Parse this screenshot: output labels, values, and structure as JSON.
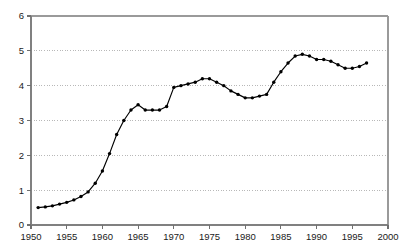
{
  "chart_data": {
    "type": "line",
    "title": "",
    "subtitle": "",
    "xlabel": "",
    "ylabel": "",
    "xlim": [
      1950,
      2000
    ],
    "ylim": [
      0,
      6
    ],
    "xticks": [
      1950,
      1955,
      1960,
      1965,
      1970,
      1975,
      1980,
      1985,
      1990,
      1995,
      2000
    ],
    "xtick_labels": [
      "1950",
      "1955",
      "1960",
      "1965",
      "1970",
      "1975",
      "1980",
      "1985",
      "1990",
      "1995",
      "2000"
    ],
    "yticks": [
      0,
      1,
      2,
      3,
      4,
      5,
      6
    ],
    "ytick_labels": [
      "0",
      "1",
      "2",
      "3",
      "4",
      "5",
      "6"
    ],
    "grid": {
      "horizontal": true,
      "vertical": false,
      "style": "dotted",
      "values": [
        1,
        2,
        3,
        4,
        5
      ]
    },
    "legend": null,
    "legend_position": "none",
    "annotations": [],
    "marker": "filled-circle",
    "line_color": "#000000",
    "marker_color": "#000000",
    "series": [
      {
        "name": "series-1",
        "x": [
          1951,
          1952,
          1953,
          1954,
          1955,
          1956,
          1957,
          1958,
          1959,
          1960,
          1961,
          1962,
          1963,
          1964,
          1965,
          1966,
          1967,
          1968,
          1969,
          1970,
          1971,
          1972,
          1973,
          1974,
          1975,
          1976,
          1977,
          1978,
          1979,
          1980,
          1981,
          1982,
          1983,
          1984,
          1985,
          1986,
          1987,
          1988,
          1989,
          1990,
          1991,
          1992,
          1993,
          1994,
          1995,
          1996,
          1997
        ],
        "values": [
          0.5,
          0.52,
          0.55,
          0.6,
          0.65,
          0.72,
          0.82,
          0.95,
          1.2,
          1.55,
          2.05,
          2.6,
          3.0,
          3.3,
          3.45,
          3.3,
          3.3,
          3.3,
          3.4,
          3.95,
          4.0,
          4.05,
          4.1,
          4.2,
          4.2,
          4.1,
          4.0,
          3.85,
          3.75,
          3.65,
          3.65,
          3.7,
          3.75,
          4.1,
          4.4,
          4.65,
          4.85,
          4.9,
          4.85,
          4.75,
          4.75,
          4.7,
          4.6,
          4.5,
          4.5,
          4.55,
          4.65
        ]
      }
    ]
  },
  "axes": {
    "y_axis_name": "value-axis",
    "x_axis_name": "year-axis"
  }
}
